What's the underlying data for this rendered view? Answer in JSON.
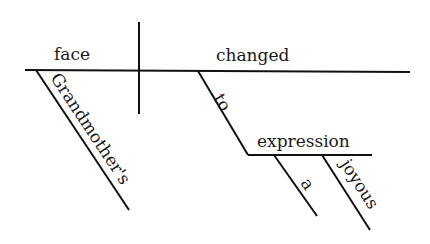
{
  "diagram": {
    "type": "sentence-diagram",
    "subject": "face",
    "verb": "changed",
    "modifiers": {
      "subject_modifier": "Grandmother's",
      "preposition": "to",
      "prepositional_object": "expression",
      "object_modifiers": [
        "a",
        "joyous"
      ]
    },
    "colors": {
      "line": "#111111",
      "text": "#1a1a1a",
      "background": "#ffffff"
    }
  }
}
